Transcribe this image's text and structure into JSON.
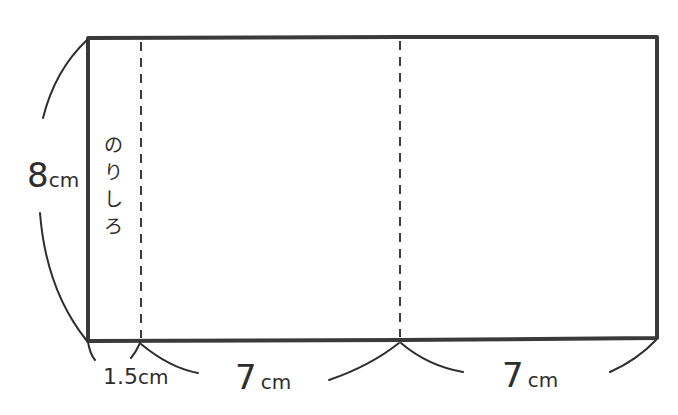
{
  "diagram": {
    "type": "net-of-paper-strip",
    "height_label": {
      "value": "8",
      "unit": "cm"
    },
    "glue_flap": {
      "label_chars": [
        "の",
        "り",
        "し",
        "ろ"
      ],
      "label_text": "のりしろ",
      "width_label": {
        "value": "1.5",
        "unit": "cm"
      }
    },
    "panels": [
      {
        "width_label": {
          "value": "7",
          "unit": "cm"
        }
      },
      {
        "width_label": {
          "value": "7",
          "unit": "cm"
        }
      }
    ],
    "colors": {
      "line": "#3a3a3a",
      "background": "#ffffff"
    }
  }
}
